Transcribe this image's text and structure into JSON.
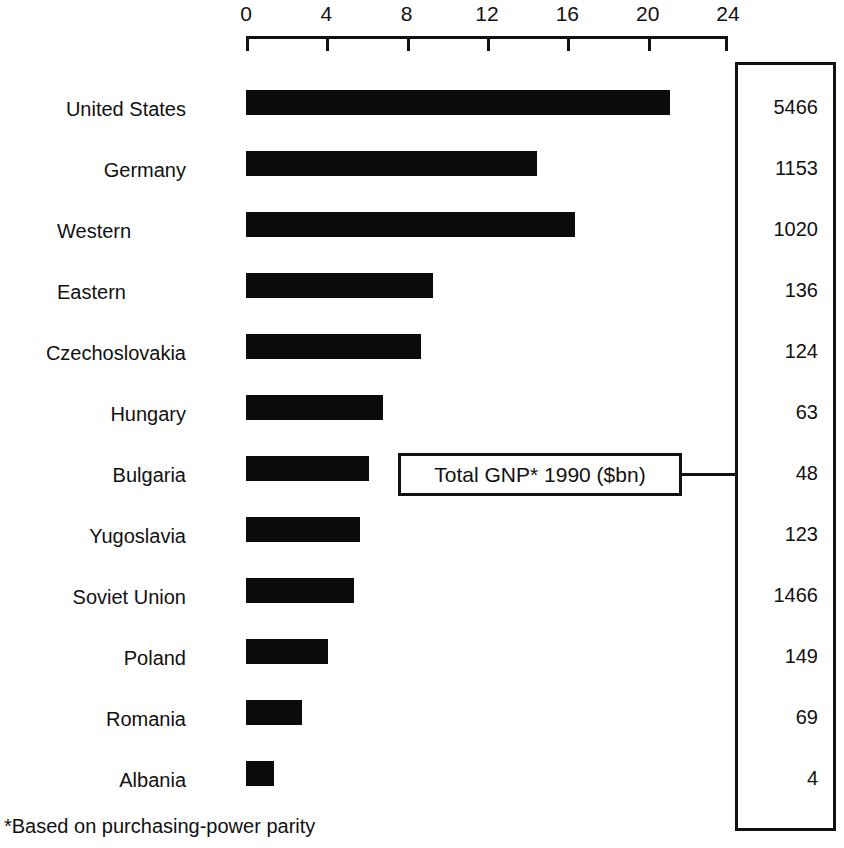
{
  "chart_data": {
    "type": "bar",
    "orientation": "horizontal",
    "title": "",
    "subtitle": "",
    "xlabel": "",
    "ylabel": "",
    "xlim": [
      0,
      24
    ],
    "xticks": [
      0,
      4,
      8,
      12,
      16,
      20,
      24
    ],
    "xtick_labels": [
      "0",
      "4",
      "8",
      "12",
      "16",
      "20",
      "24"
    ],
    "grid": false,
    "legend": "none",
    "bar_color": "#0b0b0b",
    "axis_color": "#111111",
    "categories": [
      "United States",
      "Germany",
      "Western",
      "Eastern",
      "Czechoslovakia",
      "Hungary",
      "Bulgaria",
      "Yugoslavia",
      "Soviet Union",
      "Poland",
      "Romania",
      "Albania"
    ],
    "values": [
      21.1,
      14.5,
      16.4,
      9.3,
      8.7,
      6.8,
      6.1,
      5.7,
      5.4,
      4.1,
      2.8,
      1.4
    ],
    "annotations": {
      "callout_label": "Total GNP* 1990 ($bn)",
      "footnote": "*Based on purchasing-power parity"
    },
    "side_table": {
      "header": "Total GNP* 1990 ($bn)",
      "values": [
        5466,
        1153,
        1020,
        136,
        124,
        63,
        48,
        123,
        1466,
        149,
        69,
        4
      ]
    }
  },
  "axis": {
    "ticks": [
      {
        "label": "0",
        "value": 0
      },
      {
        "label": "4",
        "value": 4
      },
      {
        "label": "8",
        "value": 8
      },
      {
        "label": "12",
        "value": 12
      },
      {
        "label": "16",
        "value": 16
      },
      {
        "label": "20",
        "value": 20
      },
      {
        "label": "24",
        "value": 24
      }
    ]
  },
  "rows": [
    {
      "label": "United States",
      "value": 21.1,
      "gnp": "5466",
      "indent": false
    },
    {
      "label": "Germany",
      "value": 14.5,
      "gnp": "1153",
      "indent": false
    },
    {
      "label": "Western",
      "value": 16.4,
      "gnp": "1020",
      "indent": true
    },
    {
      "label": "Eastern",
      "value": 9.3,
      "gnp": "136",
      "indent": true
    },
    {
      "label": "Czechoslovakia",
      "value": 8.7,
      "gnp": "124",
      "indent": false
    },
    {
      "label": "Hungary",
      "value": 6.8,
      "gnp": "63",
      "indent": false
    },
    {
      "label": "Bulgaria",
      "value": 6.1,
      "gnp": "48",
      "indent": false
    },
    {
      "label": "Yugoslavia",
      "value": 5.7,
      "gnp": "123",
      "indent": false
    },
    {
      "label": "Soviet Union",
      "value": 5.4,
      "gnp": "1466",
      "indent": false
    },
    {
      "label": "Poland",
      "value": 4.1,
      "gnp": "149",
      "indent": false
    },
    {
      "label": "Romania",
      "value": 2.8,
      "gnp": "69",
      "indent": false
    },
    {
      "label": "Albania",
      "value": 1.4,
      "gnp": "4",
      "indent": false
    }
  ],
  "callout": {
    "text": "Total GNP* 1990 ($bn)"
  },
  "footnote": {
    "asterisk": "*",
    "text": "Based on purchasing-power parity",
    "full": "*Based on purchasing-power parity"
  }
}
